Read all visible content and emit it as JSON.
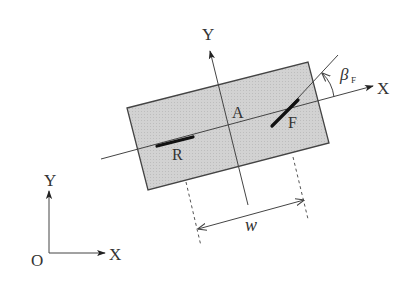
{
  "diagram": {
    "type": "vehicle bicycle model geometry",
    "colors": {
      "body_fill": "#d4d4d4",
      "line": "#444444",
      "wheel": "#111111",
      "text": "#333333"
    },
    "labels": {
      "body_y_axis": "Y",
      "body_x_axis": "X",
      "center": "A",
      "front_wheel": "F",
      "rear_wheel": "R",
      "steer_angle_symbol": "β",
      "steer_angle_subscript": "F",
      "track_width": "w",
      "global_origin": "O",
      "global_x_axis": "X",
      "global_y_axis": "Y"
    }
  }
}
